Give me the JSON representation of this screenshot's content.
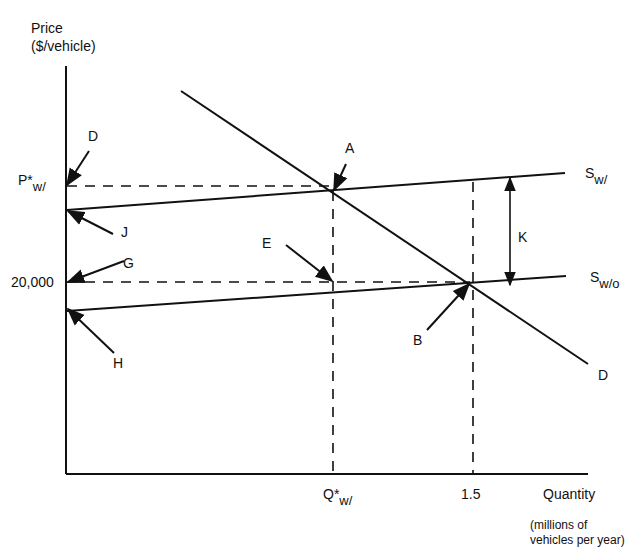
{
  "chart_data": {
    "type": "line",
    "title": "",
    "ylabel": "Price ($/vehicle)",
    "ylabel_lines": [
      "Price",
      "($/vehicle)"
    ],
    "xlabel": "Quantity",
    "xlabel_unit_lines": [
      "(millions of",
      "vehicles per year)"
    ],
    "y_ticks": [
      {
        "label": "P*w/",
        "main": "P*",
        "sub": "w/",
        "py": 186
      },
      {
        "label": "20,000",
        "main": "20,000",
        "sub": "",
        "py": 282
      }
    ],
    "x_ticks": [
      {
        "label": "Q*w/",
        "main": "Q*",
        "sub": "w/",
        "px": 333
      },
      {
        "label": "1.5",
        "main": "1.5",
        "sub": "",
        "px": 473
      }
    ],
    "grid": false,
    "legend": null,
    "series": [
      {
        "name": "D",
        "kind": "demand",
        "points_px": [
          [
            181,
            91
          ],
          [
            588,
            364
          ]
        ],
        "label_px": [
          598,
          367
        ]
      },
      {
        "name": "Sw/",
        "main": "S",
        "sub": "w/",
        "kind": "supply-with",
        "points_px": [
          [
            67,
            210
          ],
          [
            565,
            173
          ]
        ],
        "label_px": [
          585,
          165
        ]
      },
      {
        "name": "Sw/o",
        "main": "S",
        "sub": "w/o",
        "kind": "supply-without",
        "points_px": [
          [
            67,
            311
          ],
          [
            566,
            276
          ]
        ],
        "label_px": [
          590,
          269
        ]
      }
    ],
    "guides": [
      {
        "from": [
          67,
          186
        ],
        "to": [
          333,
          186
        ]
      },
      {
        "from": [
          333,
          191
        ],
        "to": [
          333,
          474
        ]
      },
      {
        "from": [
          67,
          282
        ],
        "to": [
          470,
          282
        ]
      },
      {
        "from": [
          473,
          182
        ],
        "to": [
          473,
          474
        ]
      }
    ],
    "annotations": [
      {
        "text": "A",
        "label_px": [
          345,
          140
        ],
        "arrow_from": [
          346,
          164
        ],
        "arrow_to": [
          334,
          190
        ]
      },
      {
        "text": "B",
        "label_px": [
          413,
          332
        ],
        "arrow_from": [
          427,
          330
        ],
        "arrow_to": [
          469,
          284
        ]
      },
      {
        "text": "D",
        "label_px": [
          88,
          128
        ],
        "arrow_from": [
          89,
          151
        ],
        "arrow_to": [
          67,
          185
        ]
      },
      {
        "text": "E",
        "label_px": [
          262,
          235
        ],
        "arrow_from": [
          286,
          245
        ],
        "arrow_to": [
          332,
          281
        ]
      },
      {
        "text": "G",
        "label_px": [
          123,
          255
        ],
        "arrow_from": [
          124,
          261
        ],
        "arrow_to": [
          68,
          282
        ]
      },
      {
        "text": "H",
        "label_px": [
          113,
          355
        ],
        "arrow_from": [
          114,
          353
        ],
        "arrow_to": [
          68,
          309
        ]
      },
      {
        "text": "J",
        "label_px": [
          121,
          224
        ],
        "arrow_from": [
          113,
          234
        ],
        "arrow_to": [
          68,
          211
        ]
      },
      {
        "text": "K",
        "label_px": [
          518,
          229
        ],
        "double_arrow": {
          "x": 510,
          "y1": 178,
          "y2": 285
        }
      }
    ],
    "axes_px": {
      "origin": [
        66,
        474
      ],
      "y_top": 66,
      "x_right": 588
    }
  }
}
